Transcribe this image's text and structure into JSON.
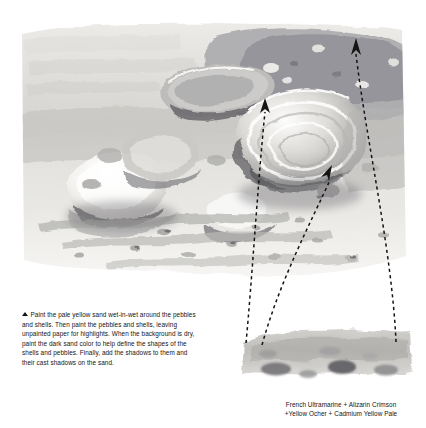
{
  "page": {
    "background_color": "#ffffff",
    "width": 426,
    "height": 428
  },
  "artwork": {
    "name": "pebbles-and-shells-watercolor-study",
    "subject": "Beach still life: pebbles, shells and sand painted wet-in-wet",
    "palette_description": "Muted grey-violet and pale ochre washes on white paper",
    "colors": {
      "paper": "#ffffff",
      "pale_sand": "#e3e2dd",
      "mid_sand": "#c9c8c4",
      "dark_sand": "#9b9b99",
      "shadow": "#6e6e70",
      "deep_shadow": "#4a4a4d",
      "accent_violet": "#8e8d98",
      "highlight": "#fafafa"
    }
  },
  "annotations": {
    "arrow_color": "#141414",
    "arrow_style": "dashed-leader-with-solid-arrowhead",
    "leaders": [
      {
        "id": 1,
        "label": "leader-to-pebble-cluster",
        "tip_x": 265,
        "tip_y": 101,
        "end_x": 246,
        "end_y": 343
      },
      {
        "id": 2,
        "label": "leader-to-shell-interior",
        "tip_x": 330,
        "tip_y": 168,
        "end_x": 262,
        "end_y": 345
      },
      {
        "id": 3,
        "label": "leader-to-upper-sand",
        "tip_x": 356,
        "tip_y": 41,
        "end_x": 396,
        "end_y": 342
      }
    ]
  },
  "caption_left": {
    "marker": "triangle-up",
    "text": "Paint the pale yellow sand wet-in-wet around the pebbles and shells. Then paint the pebbles and shells, leaving unpainted paper for highlights. When the background is dry, paint the dark sand color to help define the shapes of the shells and pebbles. Finally, add the shadows to them and their cast shadows on the sand."
  },
  "caption_right": {
    "line1": "French Ultramarine + Alizarin Crimson",
    "line2": "+Yellow Ocher + Cadmium Yellow Pale"
  },
  "swatch": {
    "name": "mixed-wash-sample",
    "description": "Loose horizontal wash of the named pigment mixture with darker granulated marks"
  }
}
